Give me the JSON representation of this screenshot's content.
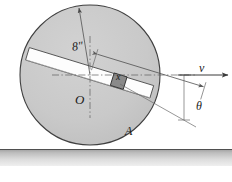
{
  "figure": {
    "background_color": "#ffffff"
  },
  "disk": {
    "name": "disk",
    "center_x": 90,
    "center_y": 75,
    "radius": 70,
    "fill_color": "#c9c9c9",
    "stroke_color": "#4a4a4a"
  },
  "rod": {
    "name": "slotted-rod",
    "angle_deg": 17,
    "fill_color": "#ffffff",
    "stroke_color": "#4a4a4a"
  },
  "slider": {
    "name": "slider-block-A",
    "fill_color": "#8a8a8a",
    "stroke_color": "#3a3a3a"
  },
  "ground": {
    "name": "ground-surface",
    "top_color": "#a8a8a8",
    "bottom_color": "#e2e2e2",
    "line_color": "#555555",
    "y": 149
  },
  "labels": {
    "radius": "8″",
    "distance_x": "x",
    "center": "O",
    "block": "A",
    "velocity": "v",
    "angle": "θ"
  },
  "annotations": {
    "radius_dimension": "8″ radius from center O to disk rim",
    "x_dimension": "x measured along rod from center O to block A",
    "velocity_arrow": "v horizontal velocity to the right",
    "angle_arc": "θ angle between horizontal reference and rod"
  },
  "colors": {
    "ink": "#1a1a1a",
    "line": "#4a4a4a",
    "thin_line": "#6a6a6a",
    "disk_fill": "#c9c9c9",
    "rod_fill": "#ffffff",
    "block_fill": "#8a8a8a"
  }
}
